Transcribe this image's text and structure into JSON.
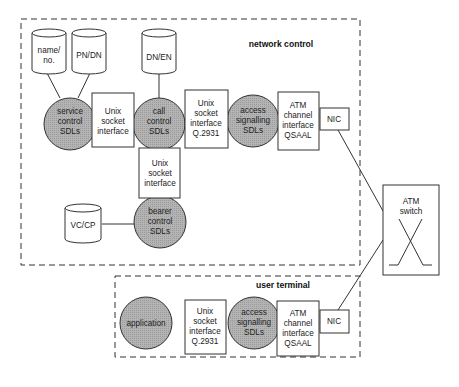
{
  "colors": {
    "sdl_fill": "#a9a9a9",
    "stroke": "#333333",
    "background": "#ffffff"
  },
  "regions": {
    "network_control": {
      "label": "network control"
    },
    "user_terminal": {
      "label": "user terminal"
    }
  },
  "network": {
    "databases": {
      "name_no": {
        "lines": [
          "name/",
          "no."
        ]
      },
      "pn_dn": {
        "lines": [
          "PN/DN"
        ]
      },
      "dn_en": {
        "lines": [
          "DN/EN"
        ]
      },
      "vc_cp": {
        "lines": [
          "VC/CP"
        ]
      }
    },
    "sdls": {
      "service_control": {
        "lines": [
          "service",
          "control",
          "SDLs"
        ]
      },
      "call_control": {
        "lines": [
          "call",
          "control",
          "SDLs"
        ]
      },
      "access_signalling": {
        "lines": [
          "access",
          "signalling",
          "SDLs"
        ]
      },
      "bearer_control": {
        "lines": [
          "bearer",
          "control",
          "SDLs"
        ]
      }
    },
    "interfaces": {
      "unix_socket_1": {
        "lines": [
          "Unix",
          "socket",
          "interface"
        ]
      },
      "unix_socket_q2931": {
        "lines": [
          "Unix",
          "socket",
          "interface",
          "Q.2931"
        ]
      },
      "atm_channel": {
        "lines": [
          "ATM",
          "channel",
          "interface",
          "QSAAL"
        ]
      },
      "nic": {
        "lines": [
          "NIC"
        ]
      },
      "unix_socket_vertical": {
        "lines": [
          "Unix",
          "socket",
          "interface"
        ]
      }
    }
  },
  "switch": {
    "lines": [
      "ATM",
      "switch"
    ]
  },
  "terminal": {
    "application": {
      "lines": [
        "application"
      ]
    },
    "unix_socket_q2931": {
      "lines": [
        "Unix",
        "socket",
        "interface",
        "Q.2931"
      ]
    },
    "access_signalling": {
      "lines": [
        "access",
        "signalling",
        "SDLs"
      ]
    },
    "atm_channel": {
      "lines": [
        "ATM",
        "channel",
        "interface",
        "QSAAL"
      ]
    },
    "nic": {
      "lines": [
        "NIC"
      ]
    }
  }
}
